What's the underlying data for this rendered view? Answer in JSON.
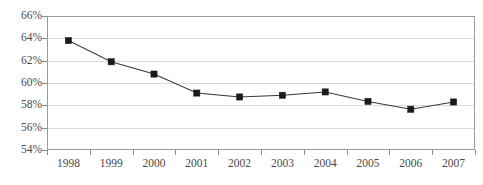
{
  "chart_data": {
    "type": "line",
    "title": "",
    "subtitle": "",
    "xlabel": "",
    "ylabel": "",
    "categories": [
      "1998",
      "1999",
      "2000",
      "2001",
      "2002",
      "2003",
      "2004",
      "2005",
      "2006",
      "2007"
    ],
    "values": [
      63.8,
      61.9,
      60.8,
      59.1,
      58.75,
      58.9,
      59.2,
      58.35,
      57.65,
      58.3
    ],
    "series": [
      {
        "name": "",
        "values": [
          63.8,
          61.9,
          60.8,
          59.1,
          58.75,
          58.9,
          59.2,
          58.35,
          57.65,
          58.3
        ]
      }
    ],
    "ylim": [
      54,
      66
    ],
    "ytick_values": [
      54,
      56,
      58,
      60,
      62,
      64,
      66
    ],
    "ytick_labels": [
      "54%",
      "56%",
      "58%",
      "60%",
      "62%",
      "64%",
      "66%"
    ],
    "xtick_labels": [
      "1998",
      "1999",
      "2000",
      "2001",
      "2002",
      "2003",
      "2004",
      "2005",
      "2006",
      "2007"
    ],
    "grid": true,
    "grid_axis": "y",
    "legend": false,
    "legend_position": "none",
    "marker": "square",
    "line_color": "#3a3a3a",
    "marker_color": "#1a1a1a",
    "grid_color": "#d9d9d9",
    "border_color": "#9a9a9a",
    "background_color": "#ffffff",
    "text_color": "#4a4a4a",
    "annotations": []
  }
}
